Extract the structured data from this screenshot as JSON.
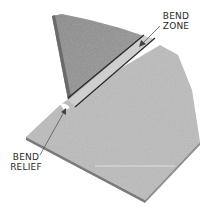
{
  "diagram": {
    "labels": {
      "bend_zone": [
        "BEND",
        "ZONE"
      ],
      "bend_relief": [
        "BEND",
        "RELIEF"
      ]
    },
    "parts": [
      "vertical-flange",
      "bend-zone",
      "base-plate",
      "bend-relief-notch"
    ],
    "colors": {
      "flange": "#8c8c8c",
      "flange_edge": "#6a6a6a",
      "plate_top": "#bdbdbd",
      "plate_edge": "#7a7a7a",
      "bend_line": "#2a2a2a",
      "label_text": "#2a2a2a"
    }
  }
}
